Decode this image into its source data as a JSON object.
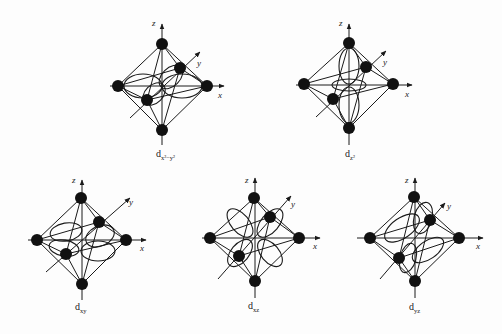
{
  "figure": {
    "axis_labels": {
      "x": "x",
      "y": "y",
      "z": "z"
    },
    "colors": {
      "line": "#1a1a1a",
      "ligand": "#111111",
      "background": "#fdfdfd"
    },
    "panels": [
      {
        "id": "dx2-y2",
        "label_main": "d",
        "label_sub": "x²−y²",
        "cx": 162,
        "cy": 86,
        "lobes": "xy-axes"
      },
      {
        "id": "dz2",
        "label_main": "d",
        "label_sub": "z²",
        "cx": 349,
        "cy": 85,
        "lobes": "z-axis-torus"
      },
      {
        "id": "dxy",
        "label_main": "d",
        "label_sub": "xy",
        "cx": 82,
        "cy": 240,
        "lobes": "xy-between"
      },
      {
        "id": "dxz",
        "label_main": "d",
        "label_sub": "xz",
        "cx": 255,
        "cy": 238,
        "lobes": "xz-between"
      },
      {
        "id": "dyz",
        "label_main": "d",
        "label_sub": "yz",
        "cx": 415,
        "cy": 238,
        "lobes": "yz-between"
      }
    ]
  }
}
